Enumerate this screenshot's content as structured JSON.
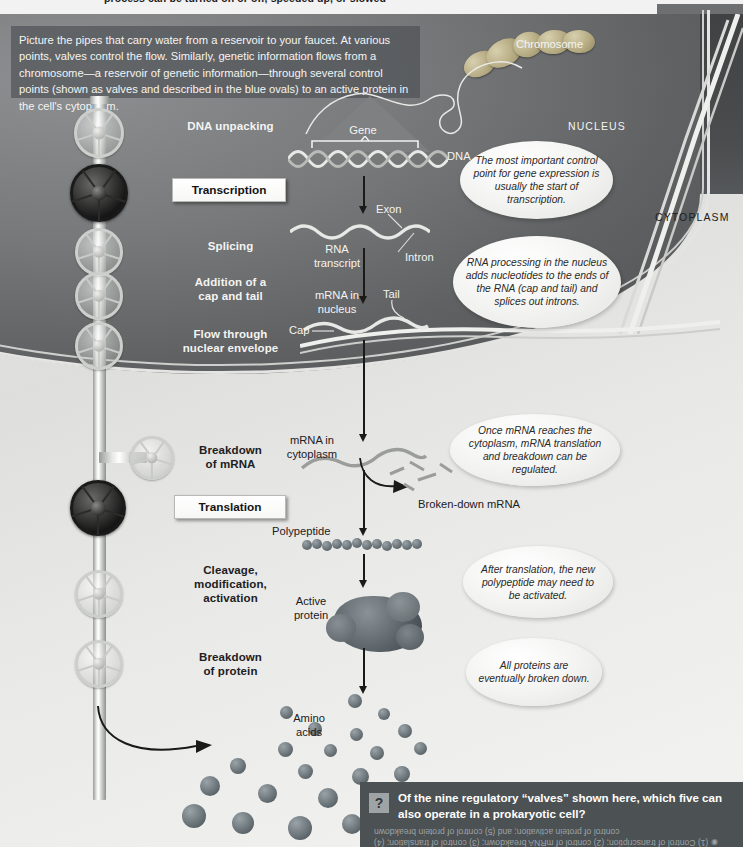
{
  "top_clipped_caption": "process can be turned on or off, speeded up, or slowed",
  "intro": {
    "text": "Picture the pipes that carry water from a reservoir to your faucet. At various points, valves control the flow.  Similarly, genetic information flows from a chromosome—a reservoir of genetic information—through several control points (shown as valves and described in the blue ovals) to an active protein in the cell's cytoplasm."
  },
  "compartments": {
    "nucleus": "NUCLEUS",
    "cytoplasm": "CYTOPLASM"
  },
  "steps": [
    {
      "label": "DNA unpacking",
      "boxed": false
    },
    {
      "label": "Transcription",
      "boxed": true
    },
    {
      "label": "Splicing",
      "boxed": false
    },
    {
      "label": "Addition of a\ncap and tail",
      "boxed": false
    },
    {
      "label": "Flow through\nnuclear envelope",
      "boxed": false
    },
    {
      "label": "Breakdown\nof mRNA",
      "boxed": false
    },
    {
      "label": "Translation",
      "boxed": true
    },
    {
      "label": "Cleavage,\nmodification,\nactivation",
      "boxed": false
    },
    {
      "label": "Breakdown\nof protein",
      "boxed": false
    }
  ],
  "structures": {
    "chromosome": "Chromosome",
    "gene": "Gene",
    "dna": "DNA",
    "exon": "Exon",
    "intron": "Intron",
    "rna_transcript": "RNA\ntranscript",
    "mrna_nucleus": "mRNA in\nnucleus",
    "tail": "Tail",
    "cap": "Cap",
    "mrna_cytoplasm": "mRNA in\ncytoplasm",
    "broken_down_mrna": "Broken-down mRNA",
    "polypeptide": "Polypeptide",
    "active_protein": "Active\nprotein",
    "amino_acids": "Amino\nacids"
  },
  "callouts": [
    {
      "id": "callout-transcription",
      "text": "The most important control point for gene expression is usually the start of transcription."
    },
    {
      "id": "callout-rna-processing",
      "text": "RNA processing in the nucleus adds nucleotides to the ends of the RNA (cap and tail) and splices out introns."
    },
    {
      "id": "callout-cytoplasm",
      "text": "Once mRNA reaches the cytoplasm, mRNA translation and breakdown can be regulated."
    },
    {
      "id": "callout-activation",
      "text": "After translation, the new polypeptide may need to be activated."
    },
    {
      "id": "callout-breakdown",
      "text": "All proteins are eventually broken down."
    }
  ],
  "question": {
    "icon": "question-mark-icon",
    "prompt": "Of the nine regulatory “valves” shown here, which five can also operate in a prokaryotic cell?",
    "answer": "(1) Control of transcription; (2) control of mRNA breakdown; (3) control of translation; (4) control of protein activation; and (5) control of protein breakdown"
  },
  "valves": [
    {
      "name": "valve-dna-unpacking",
      "state": "open"
    },
    {
      "name": "valve-transcription",
      "state": "closed"
    },
    {
      "name": "valve-splicing",
      "state": "open"
    },
    {
      "name": "valve-cap-tail",
      "state": "open"
    },
    {
      "name": "valve-nuclear-envelope",
      "state": "open"
    },
    {
      "name": "valve-mrna-breakdown",
      "state": "open"
    },
    {
      "name": "valve-translation",
      "state": "closed"
    },
    {
      "name": "valve-cleavage-modification",
      "state": "open"
    },
    {
      "name": "valve-protein-breakdown",
      "state": "open"
    }
  ],
  "colors": {
    "nucleus_fill": "#5f6162",
    "cytoplasm_fill": "#e7e7e5",
    "question_bar": "#4c5154",
    "closed_valve": "#1a1a1a",
    "callout_fill": "#f2f3f1"
  }
}
